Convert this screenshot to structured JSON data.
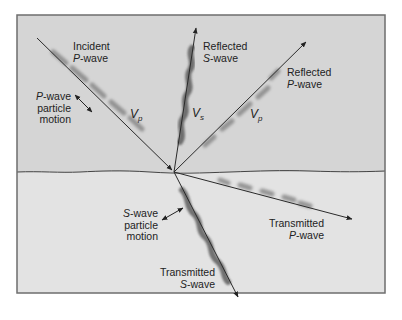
{
  "diagram": {
    "type": "seismic-wave-reflection-refraction",
    "colors": {
      "upper_medium": "#d5d5d5",
      "lower_medium": "#e3e3e3",
      "frame": "#6e6e6e",
      "ray": "#2a2a2a",
      "wave_shading": "#8a8a8a"
    },
    "labels": {
      "incident_p": {
        "line1": "Incident",
        "italic": "P",
        "line2_rest": "-wave"
      },
      "p_particle_motion": {
        "italic": "P",
        "line1_rest": "-wave",
        "line2": "particle",
        "line3": "motion"
      },
      "reflected_s": {
        "line1": "Reflected",
        "italic": "S",
        "line2_rest": "-wave"
      },
      "reflected_p": {
        "line1": "Reflected",
        "italic": "P",
        "line2_rest": "-wave"
      },
      "s_particle_motion": {
        "italic": "S",
        "line1_rest": "-wave",
        "line2": "particle",
        "line3": "motion"
      },
      "transmitted_p": {
        "line1": "Transmitted",
        "italic": "P",
        "line2_rest": "-wave"
      },
      "transmitted_s": {
        "line1": "Transmitted",
        "italic": "S",
        "line2_rest": "-wave"
      }
    },
    "velocities": {
      "incident_vp": {
        "main": "V",
        "sub": "p"
      },
      "reflected_vs": {
        "main": "V",
        "sub": "s"
      },
      "reflected_vp": {
        "main": "V",
        "sub": "p"
      }
    }
  }
}
